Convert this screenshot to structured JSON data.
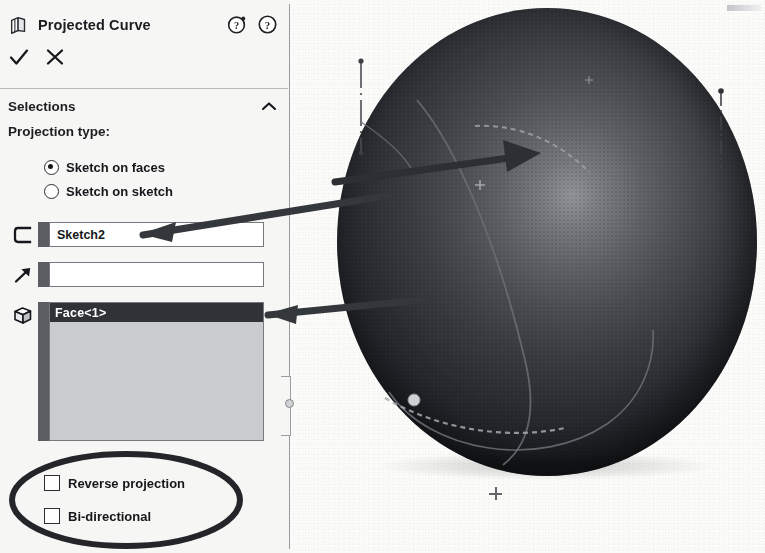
{
  "window": {
    "title": "Projected Curve",
    "title_icon": "projected-curve-icon"
  },
  "header": {
    "dynamic_help_icon": "question-mark-sparkle-icon",
    "help_icon": "question-mark-icon",
    "ok_icon": "check-mark-icon",
    "cancel_icon": "x-mark-icon"
  },
  "selections": {
    "section_label": "Selections",
    "collapse_icon": "chevron-up-icon",
    "projection_type_label": "Projection type:",
    "options": [
      {
        "label": "Sketch on faces",
        "selected": true
      },
      {
        "label": "Sketch on sketch",
        "selected": false
      }
    ],
    "sketch_field": {
      "icon": "sketch-curve-icon",
      "value": "Sketch2",
      "placeholder": ""
    },
    "direction_field": {
      "icon": "direction-arrow-icon",
      "value": "",
      "placeholder": ""
    },
    "faces_list": {
      "icon": "face-cube-icon",
      "items": [
        "Face<1>"
      ]
    },
    "checkboxes": [
      {
        "label": "Reverse projection",
        "checked": false
      },
      {
        "label": "Bi-directional",
        "checked": false
      }
    ]
  },
  "viewport": {
    "model": "shaded-sphere",
    "cursor_marker": "crosshair-plus-icon",
    "axes": [
      "vertical-dash-dot-axis-left",
      "vertical-dash-dot-axis-right"
    ],
    "curves": [
      "projected-curve-dashed",
      "sketch-curve-solid",
      "silhouette-circle"
    ],
    "vertex_marker": "highlighted-vertex-dot"
  },
  "annotations": {
    "arrow_to_sketch_field": "arrow-pointing-from-sphere-to-sketch-field",
    "arrow_to_face_list": "arrow-pointing-from-sphere-to-face-list",
    "sphere_arrow": "arrow-on-sphere",
    "ellipse_highlight": "ellipse-around-checkboxes"
  },
  "colors": {
    "panel_background": "#f6f6f5",
    "accent_bar": "#5a5d62",
    "selection_highlight": "#2f3237",
    "list_background": "#c9cbcd",
    "annotation": "#33363a",
    "text": "#15171a",
    "border": "#767a7e"
  }
}
